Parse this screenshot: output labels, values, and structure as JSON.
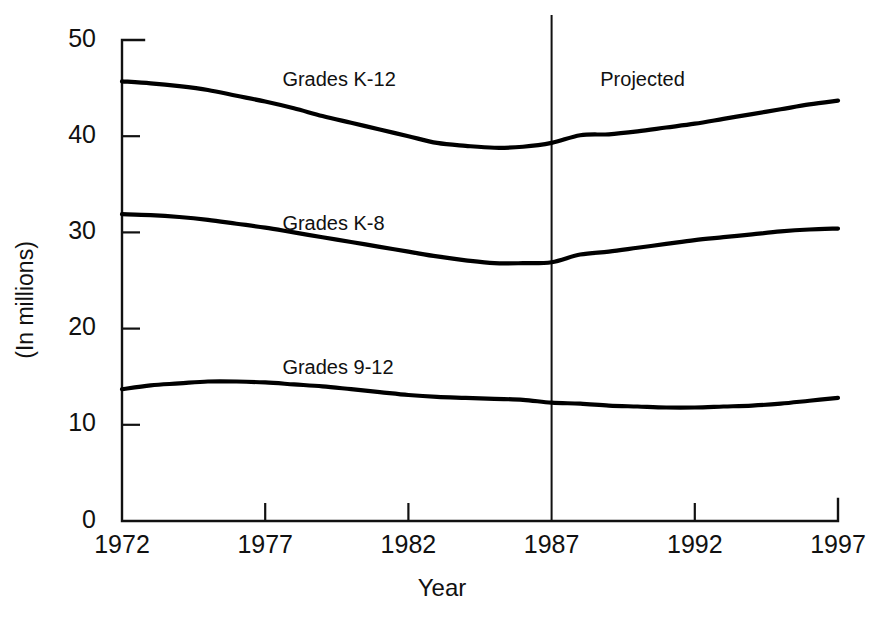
{
  "chart_data": {
    "type": "line",
    "title": "",
    "subtitle": "",
    "xlabel": "Year",
    "ylabel": "(In millions)",
    "xlim": [
      1972,
      1997
    ],
    "ylim": [
      0,
      50
    ],
    "grid": false,
    "legend_position": "inline-series-labels",
    "x_ticks": [
      1972,
      1977,
      1982,
      1987,
      1992,
      1997
    ],
    "x_tick_labels": [
      "1972",
      "1977",
      "1982",
      "1987",
      "1992",
      "1997"
    ],
    "y_ticks": [
      0,
      10,
      20,
      30,
      40,
      50
    ],
    "y_tick_labels": [
      "0",
      "10",
      "20",
      "30",
      "40",
      "50"
    ],
    "x": [
      1972,
      1973,
      1974,
      1975,
      1976,
      1977,
      1978,
      1979,
      1980,
      1981,
      1982,
      1983,
      1984,
      1985,
      1986,
      1987,
      1988,
      1989,
      1990,
      1991,
      1992,
      1993,
      1994,
      1995,
      1996,
      1997
    ],
    "series": [
      {
        "name": "Grades K-12",
        "label": "Grades K-12",
        "color": "#000000",
        "values": [
          45.7,
          45.5,
          45.2,
          44.8,
          44.2,
          43.6,
          42.9,
          42.1,
          41.4,
          40.7,
          40.0,
          39.3,
          39.0,
          38.8,
          38.9,
          39.3,
          40.1,
          40.2,
          40.5,
          40.9,
          41.3,
          41.8,
          42.3,
          42.8,
          43.3,
          43.7
        ]
      },
      {
        "name": "Grades K-8",
        "label": "Grades K-8",
        "color": "#000000",
        "values": [
          31.9,
          31.8,
          31.6,
          31.3,
          30.9,
          30.5,
          30.0,
          29.5,
          29.0,
          28.5,
          28.0,
          27.5,
          27.1,
          26.8,
          26.8,
          26.9,
          27.7,
          28.0,
          28.4,
          28.8,
          29.2,
          29.5,
          29.8,
          30.1,
          30.3,
          30.4
        ]
      },
      {
        "name": "Grades 9-12",
        "label": "Grades 9-12",
        "color": "#000000",
        "values": [
          13.7,
          14.1,
          14.3,
          14.5,
          14.5,
          14.4,
          14.2,
          14.0,
          13.7,
          13.4,
          13.1,
          12.9,
          12.8,
          12.7,
          12.6,
          12.3,
          12.2,
          12.0,
          11.9,
          11.8,
          11.8,
          11.9,
          12.0,
          12.2,
          12.5,
          12.8
        ]
      }
    ],
    "series_label_positions": [
      {
        "label": "Grades K-12",
        "x": 1977.6,
        "y": 46.7
      },
      {
        "label": "Grades K-8",
        "x": 1977.6,
        "y": 31.7
      },
      {
        "label": "Grades 9-12",
        "x": 1977.6,
        "y": 16.8
      }
    ],
    "annotations": [
      {
        "text": "Projected",
        "x": 1988.7,
        "y": 46.7,
        "type": "text-label"
      },
      {
        "text": "",
        "x": 1987,
        "type": "vertical-divider",
        "y_from": 0,
        "y_to": 52.6
      }
    ]
  },
  "colors": {
    "background": "#ffffff",
    "ink": "#111111",
    "series": "#000000"
  }
}
